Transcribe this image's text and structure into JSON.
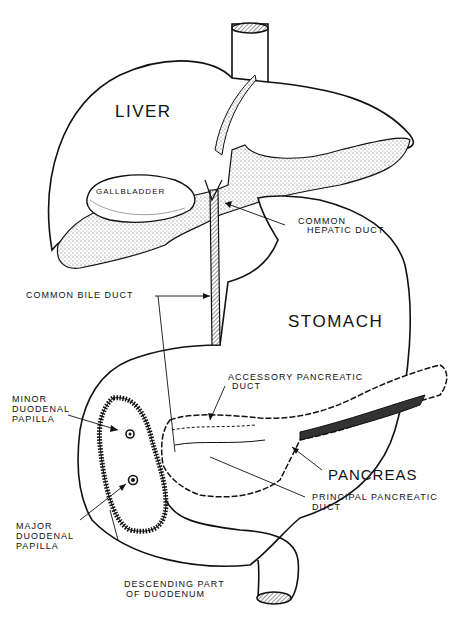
{
  "diagram": {
    "type": "anatomical-illustration",
    "organs": {
      "liver": "LIVER",
      "stomach": "STOMACH",
      "pancreas": "PANCREAS",
      "gallbladder": "GALLBLADDER"
    },
    "labels": {
      "common_hepatic_duct_1": "COMMON",
      "common_hepatic_duct_2": "HEPATIC DUCT",
      "common_bile_duct": "COMMON BILE DUCT",
      "accessory_pancreatic_duct_1": "ACCESSORY PANCREATIC",
      "accessory_pancreatic_duct_2": "DUCT",
      "minor_papilla_1": "MINOR",
      "minor_papilla_2": "DUODENAL",
      "minor_papilla_3": "PAPILLA",
      "major_papilla_1": "MAJOR",
      "major_papilla_2": "DUODENAL",
      "major_papilla_3": "PAPILLA",
      "principal_pancreatic_duct_1": "PRINCIPAL PANCREATIC",
      "principal_pancreatic_duct_2": "DUCT",
      "descending_duodenum_1": "DESCENDING PART",
      "descending_duodenum_2": "OF DUODENUM"
    },
    "colors": {
      "ink": "#111111",
      "background": "#ffffff",
      "stipple": "#555555"
    }
  }
}
